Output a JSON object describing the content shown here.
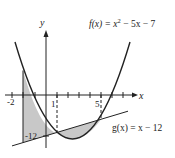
{
  "diagram": {
    "type": "function-graph",
    "axes": {
      "x_label": "x",
      "y_label": "y",
      "x_ticks": [
        "-2",
        "1",
        "5"
      ],
      "y_ticks": [
        "-12"
      ]
    },
    "functions": [
      {
        "name": "f",
        "label": "f(x) = x² − 5x − 7",
        "label_prefix": "f(x) = x",
        "label_sup": "2",
        "label_suffix": " − 5x − 7",
        "expression": "x^2 - 5x - 7",
        "kind": "parabola"
      },
      {
        "name": "g",
        "label": "g(x) = x − 12",
        "expression": "x - 12",
        "kind": "line"
      }
    ],
    "shaded_regions": [
      {
        "description": "region between f and g from x = -2 to x = 1",
        "from": -2,
        "to": 1
      },
      {
        "description": "region between g and f from x = 1 to x = 5",
        "from": 1,
        "to": 5
      }
    ],
    "dashed_lines": [
      {
        "at_x": 1
      },
      {
        "at_x": 5
      }
    ],
    "colors": {
      "curve": "#222222",
      "shade": "#c8c8c8",
      "axis": "#222222"
    }
  }
}
